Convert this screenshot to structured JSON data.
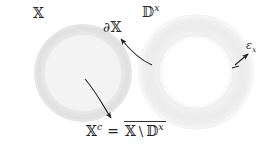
{
  "figure": {
    "background_color": "#ffffff",
    "labels": {
      "space": "𝕏",
      "boundary": "∂𝕏",
      "disk": "𝔻",
      "disk_superscript": "x",
      "epsilon": "ε",
      "epsilon_subscript": "x"
    },
    "formula": {
      "lhs_base": "𝕏",
      "lhs_superscript": "c",
      "equals": "=",
      "rhs_first": "𝕏",
      "setminus": "\\",
      "rhs_second": "𝔻",
      "rhs_second_superscript": "x",
      "full_text": "𝕏ᶜ = closure(𝕏 \\ 𝔻ˣ)"
    },
    "shapes": {
      "left_disk": {
        "name": "filled-disk-X",
        "center_x": 83,
        "center_y": 73,
        "outer_radius": 49,
        "inner_radius": 40,
        "fill_color": "#f2f2f2",
        "ring_color": "#e2e2e2"
      },
      "right_annulus": {
        "name": "annulus-Dx",
        "center_x": 196,
        "center_y": 72,
        "outer_radius": 58,
        "inner_radius": 37,
        "fill_color": "#fbfbfb",
        "ring_color": "#ededed"
      }
    },
    "arrows": [
      {
        "name": "arrow-to-complement-formula",
        "from_x": 85,
        "from_y": 78,
        "to_x": 111,
        "to_y": 119,
        "color": "#222222"
      },
      {
        "name": "arrow-to-boundary-label",
        "from_x": 150,
        "from_y": 64,
        "to_x": 119,
        "to_y": 37,
        "color": "#222222"
      },
      {
        "name": "arrow-to-epsilon-label",
        "from_x": 237,
        "from_y": 66,
        "to_x": 250,
        "to_y": 52,
        "color": "#222222"
      }
    ]
  }
}
